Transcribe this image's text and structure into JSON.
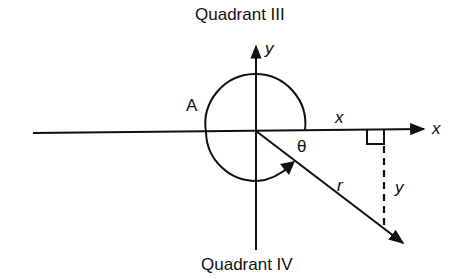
{
  "diagram": {
    "type": "angle in standard position (quadrant IV)",
    "labels": {
      "top_quadrant": "Quadrant III",
      "bottom_quadrant": "Quadrant IV",
      "y_axis": "y",
      "x_axis": "x",
      "arc_label": "A",
      "angle": "θ",
      "adjacent_side": "x",
      "hypotenuse": "r",
      "opposite_side": "y"
    },
    "elements": {
      "origin": [
        255,
        131
      ],
      "x_axis": {
        "from": [
          33,
          133
        ],
        "to": [
          425,
          129
        ]
      },
      "y_axis": {
        "from": [
          257,
          250
        ],
        "to": [
          257,
          45
        ]
      },
      "arc_radius": 50,
      "ray_r": {
        "from": [
          255,
          131
        ],
        "to": [
          403,
          244
        ]
      },
      "perpendicular_x": 385,
      "colors": {
        "ink": "#111111",
        "background": "#ffffff"
      }
    }
  }
}
